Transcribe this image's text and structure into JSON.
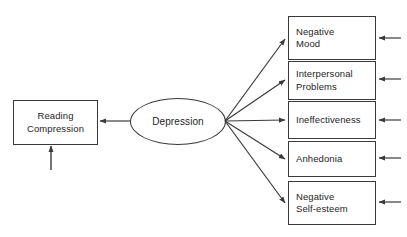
{
  "diagram": {
    "type": "path-model",
    "title": "",
    "background_color": "#ffffff",
    "stroke_color": "#3a3a3a",
    "text_color": "#1e1e1e",
    "latent_variable": {
      "label": "Depression",
      "shape": "ellipse"
    },
    "outcome": {
      "label": "Reading\nCompression",
      "shape": "rectangle"
    },
    "indicators": [
      {
        "label": "Negative\nMood",
        "shape": "rectangle",
        "lines": 2
      },
      {
        "label": "Interpersonal\nProblems",
        "shape": "rectangle",
        "lines": 2
      },
      {
        "label": "Ineffectiveness",
        "shape": "rectangle",
        "lines": 1
      },
      {
        "label": "Anhedonia",
        "shape": "rectangle",
        "lines": 1
      },
      {
        "label": "Negative\nSelf-esteem",
        "shape": "rectangle",
        "lines": 2
      }
    ],
    "paths": [
      {
        "from": "Depression",
        "to": "Reading Compression",
        "direction": "left"
      },
      {
        "from": "Depression",
        "to": "Negative Mood",
        "direction": "right"
      },
      {
        "from": "Depression",
        "to": "Interpersonal Problems",
        "direction": "right"
      },
      {
        "from": "Depression",
        "to": "Ineffectiveness",
        "direction": "right"
      },
      {
        "from": "Depression",
        "to": "Anhedonia",
        "direction": "right"
      },
      {
        "from": "Depression",
        "to": "Negative Self-esteem",
        "direction": "right"
      }
    ],
    "residual_arrows": [
      {
        "target": "Reading Compression",
        "direction": "up"
      },
      {
        "target": "Negative Mood",
        "direction": "left"
      },
      {
        "target": "Interpersonal Problems",
        "direction": "left"
      },
      {
        "target": "Ineffectiveness",
        "direction": "left"
      },
      {
        "target": "Anhedonia",
        "direction": "left"
      },
      {
        "target": "Negative Self-esteem",
        "direction": "left"
      }
    ]
  }
}
